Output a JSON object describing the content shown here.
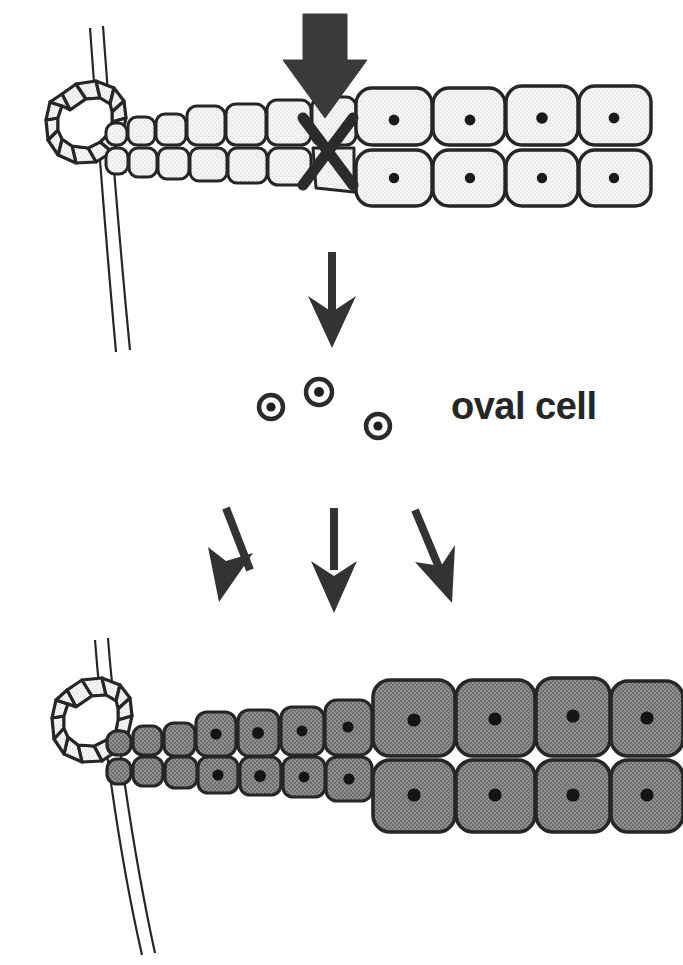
{
  "figure": {
    "background_color": "#ffffff",
    "ink_color": "#262626",
    "labels": {
      "oval_cell": "oval cell"
    }
  },
  "palette": {
    "outline": "#262626",
    "cell_fill_light": "#f2f2f0",
    "cell_fill_gray": "#8a8a8a",
    "nucleus": "#1a1a1a",
    "vessel_line": "#262626",
    "arrow_fill": "#3a3a3a",
    "white": "#ffffff"
  },
  "panels": [
    {
      "id": "top-panel",
      "name": "damaged-liver-panel",
      "description": "Bile duct with hepatocyte cords; block arrow and X mark indicate blocked hepatocyte replication",
      "duct": {
        "name": "bile-duct-ring",
        "segments": 12,
        "fill": "#f2f2f0",
        "lumen_fill": "#ffffff"
      },
      "vessel": {
        "name": "portal-vessel",
        "lines": 2
      },
      "rows": [
        {
          "name": "hepatocyte-cord-upper",
          "cells": [
            {
              "size": "xsmall",
              "nucleus": false
            },
            {
              "size": "small",
              "nucleus": false
            },
            {
              "size": "small",
              "nucleus": false
            },
            {
              "size": "medium",
              "nucleus": false
            },
            {
              "size": "medium",
              "nucleus": false
            },
            {
              "size": "medium",
              "nucleus": false
            },
            {
              "size": "medium",
              "nucleus": false
            },
            {
              "size": "large",
              "nucleus": true
            },
            {
              "size": "large",
              "nucleus": true
            },
            {
              "size": "large",
              "nucleus": true
            },
            {
              "size": "large",
              "nucleus": true
            }
          ]
        },
        {
          "name": "hepatocyte-cord-lower",
          "cells": [
            {
              "size": "xsmall",
              "nucleus": false
            },
            {
              "size": "small",
              "nucleus": false
            },
            {
              "size": "small",
              "nucleus": false
            },
            {
              "size": "medium",
              "nucleus": false
            },
            {
              "size": "medium",
              "nucleus": false
            },
            {
              "size": "medium",
              "nucleus": false
            },
            {
              "size": "medium",
              "nucleus": false
            },
            {
              "size": "large",
              "nucleus": true
            },
            {
              "size": "large",
              "nucleus": true
            },
            {
              "size": "large",
              "nucleus": true
            },
            {
              "size": "large",
              "nucleus": true
            }
          ]
        }
      ],
      "markers": [
        {
          "name": "block-arrow-down",
          "type": "block-arrow",
          "direction": "down"
        },
        {
          "name": "x-mark",
          "type": "cross",
          "meaning": "blocked-replication"
        }
      ]
    },
    {
      "id": "middle-panel",
      "name": "oval-cell-panel",
      "oval_cells": [
        {
          "name": "oval-cell-1"
        },
        {
          "name": "oval-cell-2"
        },
        {
          "name": "oval-cell-3"
        }
      ],
      "label": "oval cell"
    },
    {
      "id": "bottom-panel",
      "name": "regenerated-liver-panel",
      "description": "Bile duct with oval-cell-derived (gray/labelled) hepatocyte cords",
      "duct": {
        "name": "bile-duct-ring",
        "segments": 12,
        "fill": "#f2f2f0",
        "lumen_fill": "#ffffff"
      },
      "vessel": {
        "name": "portal-vessel",
        "lines": 2
      },
      "rows": [
        {
          "name": "hepatocyte-cord-upper",
          "cells": [
            {
              "size": "xsmall",
              "nucleus": false,
              "fill": "gray"
            },
            {
              "size": "small",
              "nucleus": false,
              "fill": "gray"
            },
            {
              "size": "small",
              "nucleus": false,
              "fill": "gray"
            },
            {
              "size": "medium",
              "nucleus": true,
              "fill": "gray"
            },
            {
              "size": "medium",
              "nucleus": true,
              "fill": "gray"
            },
            {
              "size": "medium",
              "nucleus": true,
              "fill": "gray"
            },
            {
              "size": "medium",
              "nucleus": true,
              "fill": "gray"
            },
            {
              "size": "large",
              "nucleus": true,
              "fill": "gray"
            },
            {
              "size": "large",
              "nucleus": true,
              "fill": "gray"
            },
            {
              "size": "large",
              "nucleus": true,
              "fill": "gray"
            },
            {
              "size": "large",
              "nucleus": true,
              "fill": "gray"
            }
          ]
        },
        {
          "name": "hepatocyte-cord-lower",
          "cells": [
            {
              "size": "xsmall",
              "nucleus": false,
              "fill": "gray"
            },
            {
              "size": "small",
              "nucleus": false,
              "fill": "gray"
            },
            {
              "size": "small",
              "nucleus": false,
              "fill": "gray"
            },
            {
              "size": "medium",
              "nucleus": true,
              "fill": "gray"
            },
            {
              "size": "medium",
              "nucleus": true,
              "fill": "gray"
            },
            {
              "size": "medium",
              "nucleus": true,
              "fill": "gray"
            },
            {
              "size": "medium",
              "nucleus": true,
              "fill": "gray"
            },
            {
              "size": "large",
              "nucleus": true,
              "fill": "gray"
            },
            {
              "size": "large",
              "nucleus": true,
              "fill": "gray"
            },
            {
              "size": "large",
              "nucleus": true,
              "fill": "gray"
            },
            {
              "size": "large",
              "nucleus": true,
              "fill": "gray"
            }
          ]
        }
      ]
    }
  ],
  "arrows": [
    {
      "name": "arrow-block-down",
      "style": "block",
      "direction": "down",
      "from": "damage-stimulus",
      "to": "x-mark"
    },
    {
      "name": "arrow-to-oval-cells",
      "style": "thin",
      "direction": "down",
      "from": "top-panel",
      "to": "oval-cell-panel"
    },
    {
      "name": "arrow-differentiate-left",
      "style": "thin",
      "direction": "down-left",
      "from": "oval-cell-panel",
      "to": "bottom-panel"
    },
    {
      "name": "arrow-differentiate-center",
      "style": "thin",
      "direction": "down",
      "from": "oval-cell-panel",
      "to": "bottom-panel"
    },
    {
      "name": "arrow-differentiate-right",
      "style": "thin",
      "direction": "down-right",
      "from": "oval-cell-panel",
      "to": "bottom-panel"
    }
  ]
}
